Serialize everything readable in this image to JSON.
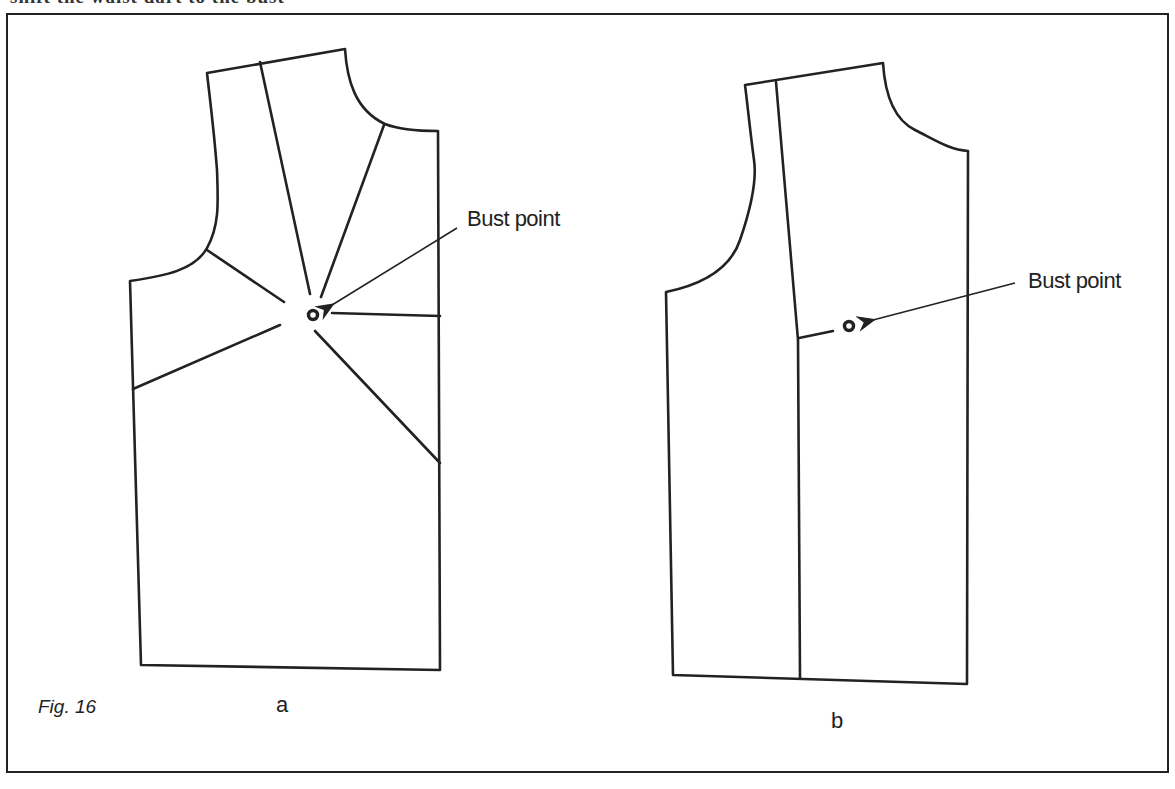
{
  "header": {
    "cut_text": "shift the waist dart to the bust"
  },
  "figure": {
    "caption": "Fig. 16",
    "panels": [
      {
        "id": "a",
        "label": "a",
        "annotation": "Bust point"
      },
      {
        "id": "b",
        "label": "b",
        "annotation": "Bust point"
      }
    ]
  },
  "colors": {
    "ink": "#222222",
    "background": "#ffffff"
  }
}
